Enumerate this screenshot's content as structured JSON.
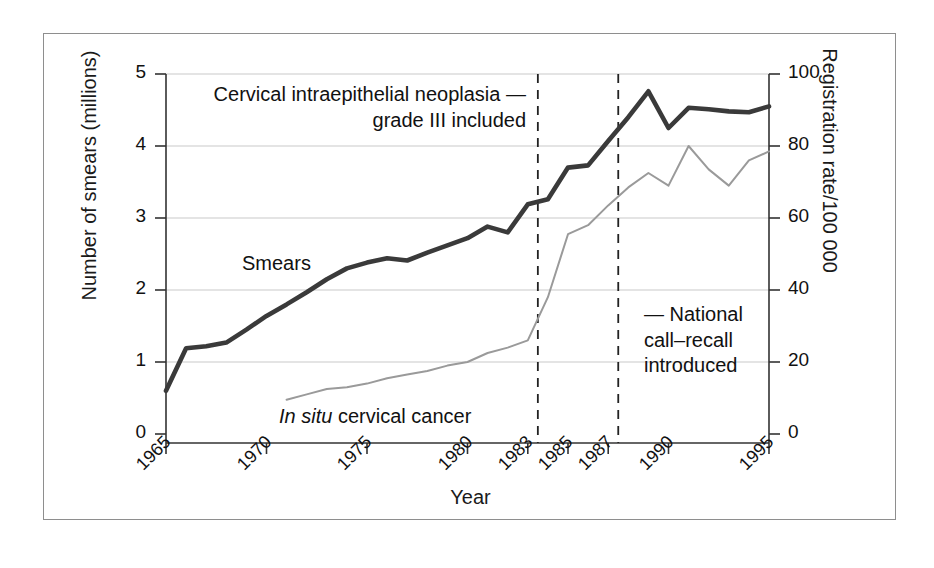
{
  "figure": {
    "xlabel": "Year",
    "ylabel_left": "Number of smears (millions)",
    "ylabel_right": "Registration rate/100 000"
  },
  "annotations": {
    "cin_note": "Cervical intraepithelial neoplasia —\ngrade III included",
    "call_recall_note": "— National\ncall–recall\nintroduced",
    "series_label_smears": "Smears",
    "series_label_insitu_italic": "In situ",
    "series_label_insitu_rest": " cervical cancer"
  },
  "axes": {
    "y_left_ticks": [
      "0",
      "1",
      "2",
      "3",
      "4",
      "5"
    ],
    "y_right_ticks": [
      "0",
      "20",
      "40",
      "60",
      "80",
      "100"
    ],
    "x_ticks": [
      "1965",
      "1970",
      "1975",
      "1980",
      "1983",
      "1985",
      "1987",
      "1990",
      "1995"
    ]
  },
  "colors": {
    "smears_line": "#3a3a3a",
    "insitu_line": "#9a9a9a",
    "gridline": "#c9c9c9",
    "axis": "#333333",
    "frame": "#8e8e8e",
    "shadow": "#9a9a9a"
  },
  "chart_data": {
    "type": "line",
    "title": "",
    "xlabel": "Year",
    "ylabel": "Number of smears (millions)",
    "ylabel_secondary": "Registration rate/100 000",
    "xlim": [
      1965,
      1995
    ],
    "ylim": [
      0,
      5
    ],
    "ylim_secondary": [
      0,
      100
    ],
    "grid": true,
    "legend": "inline-labels",
    "xticks": [
      1965,
      1970,
      1975,
      1980,
      1983,
      1985,
      1987,
      1990,
      1995
    ],
    "yticks_left": [
      0,
      1,
      2,
      3,
      4,
      5
    ],
    "yticks_right": [
      0,
      20,
      40,
      60,
      80,
      100
    ],
    "vertical_reference_lines": [
      {
        "x": 1983.5,
        "style": "dashed",
        "label": "Cervical intraepithelial neoplasia — grade III included"
      },
      {
        "x": 1987.5,
        "style": "dashed",
        "label": "National call–recall introduced"
      }
    ],
    "series": [
      {
        "name": "Smears",
        "axis": "left",
        "units": "millions",
        "color": "#3a3a3a",
        "x": [
          1965,
          1966,
          1967,
          1968,
          1969,
          1970,
          1971,
          1972,
          1973,
          1974,
          1975,
          1976,
          1977,
          1978,
          1979,
          1980,
          1981,
          1982,
          1983,
          1984,
          1985,
          1986,
          1987,
          1988,
          1989,
          1990,
          1991,
          1992,
          1993,
          1994,
          1995
        ],
        "values": [
          0.6,
          1.19,
          1.22,
          1.27,
          1.45,
          1.64,
          1.8,
          1.97,
          2.15,
          2.3,
          2.38,
          2.44,
          2.41,
          2.52,
          2.62,
          2.72,
          2.88,
          2.8,
          3.19,
          3.26,
          3.7,
          3.73,
          4.07,
          4.4,
          4.76,
          4.25,
          4.53,
          4.51,
          4.48,
          4.47,
          4.55
        ]
      },
      {
        "name": "In situ cervical cancer",
        "axis": "right",
        "units": "registrations per 100 000",
        "color": "#9a9a9a",
        "x": [
          1971,
          1972,
          1973,
          1974,
          1975,
          1976,
          1977,
          1978,
          1979,
          1980,
          1981,
          1982,
          1983,
          1984,
          1985,
          1986,
          1987,
          1988,
          1989,
          1990,
          1991,
          1992,
          1993,
          1994,
          1995
        ],
        "values": [
          9.5,
          11.0,
          12.5,
          13.0,
          14.0,
          15.5,
          16.5,
          17.5,
          19.0,
          20.0,
          22.5,
          24.0,
          26.0,
          38.0,
          55.5,
          58.0,
          63.5,
          68.5,
          72.5,
          69.0,
          80.0,
          73.5,
          69.0,
          76.0,
          78.5
        ]
      }
    ]
  }
}
